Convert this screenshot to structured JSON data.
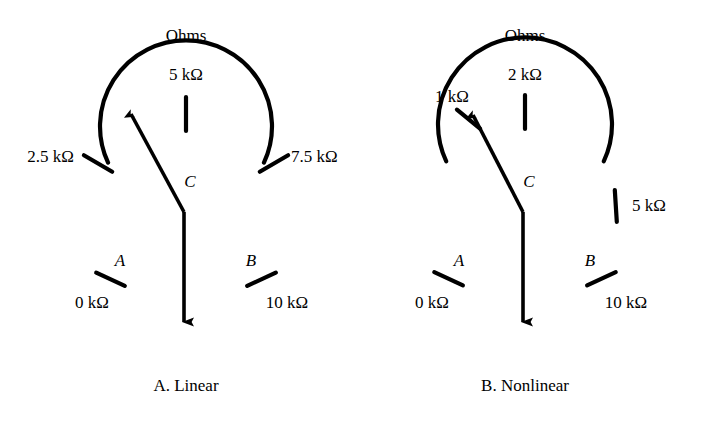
{
  "figure": {
    "background_color": "#ffffff",
    "ink_color": "#000000",
    "panels": [
      {
        "id": "panel-a",
        "caption": "A. Linear",
        "units_heading": "Ohms",
        "pivot_label": "C",
        "terminal_labels": {
          "left": "A",
          "right": "B"
        },
        "scale_type": "linear",
        "dial": {
          "center_x": 186,
          "center_y": 199,
          "radius": 86,
          "start_angle_deg": 205,
          "end_angle_deg": 335
        },
        "ticks": [
          {
            "label": "0 kΩ",
            "value": 0,
            "angle_deg": 205,
            "label_x": 93,
            "label_y": 303,
            "align": "center"
          },
          {
            "label": "2.5 kΩ",
            "value": 2.5,
            "angle_deg": 237.5,
            "label_x": 70,
            "label_y": 158,
            "align": "right"
          },
          {
            "label": "5 kΩ",
            "value": 5,
            "angle_deg": 270,
            "label_x": 186,
            "label_y": 68,
            "align": "center"
          },
          {
            "label": "7.5 kΩ",
            "value": 7.5,
            "angle_deg": 302.5,
            "label_x": 292,
            "label_y": 158,
            "align": "left"
          },
          {
            "label": "10 kΩ",
            "value": 10,
            "angle_deg": 335,
            "label_x": 285,
            "label_y": 303,
            "align": "center"
          }
        ],
        "pointer": {
          "value_angle_deg": 252,
          "pivot_x": 184,
          "pivot_y": 212,
          "tip_x": 127,
          "tip_y": 107,
          "shaft_bottom_y": 334
        }
      },
      {
        "id": "panel-b",
        "caption": "B. Nonlinear",
        "units_heading": "Ohms",
        "pivot_label": "C",
        "terminal_labels": {
          "left": "A",
          "right": "B"
        },
        "scale_type": "nonlinear",
        "dial": {
          "center_x": 525,
          "center_y": 198,
          "radius": 87,
          "start_angle_deg": 205,
          "end_angle_deg": 335
        },
        "ticks": [
          {
            "label": "0 kΩ",
            "value": 0,
            "angle_deg": 205,
            "label_x": 433,
            "label_y": 303,
            "align": "center"
          },
          {
            "label": "1 kΩ",
            "value": 1,
            "angle_deg": 242,
            "label_x": 452,
            "label_y": 66,
            "align": "center"
          },
          {
            "label": "2 kΩ",
            "value": 2,
            "angle_deg": 270,
            "label_x": 525,
            "label_y": 68,
            "align": "center"
          },
          {
            "label": "5 kΩ",
            "value": 5,
            "angle_deg": 356,
            "label_x": 634,
            "label_y": 198,
            "align": "left"
          },
          {
            "label": "10 kΩ",
            "value": 10,
            "angle_deg": 335,
            "label_x": 623,
            "label_y": 303,
            "align": "center"
          }
        ],
        "pointer": {
          "value_angle_deg": 245,
          "pivot_x": 523,
          "pivot_y": 212,
          "tip_x": 469,
          "tip_y": 108,
          "shaft_bottom_y": 334
        }
      }
    ]
  }
}
